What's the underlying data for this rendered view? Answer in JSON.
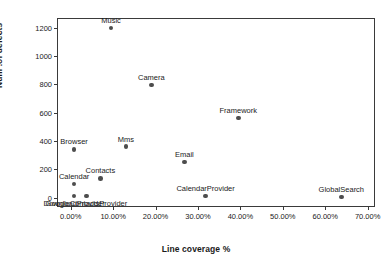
{
  "chart_data": {
    "type": "scatter",
    "title": "",
    "xlabel": "Line coverage %",
    "ylabel": "Num .of defects",
    "xlim": [
      -3.0,
      71.5
    ],
    "ylim": [
      -60,
      1260
    ],
    "grid": false,
    "legend": "none",
    "xticks": [
      "0.00%",
      "10.00%",
      "20.00%",
      "30.00%",
      "40.00%",
      "50.00%",
      "60.00%",
      "70.00%"
    ],
    "xtick_values": [
      0,
      10,
      20,
      30,
      40,
      50,
      60,
      70
    ],
    "yticks": [
      "0",
      "200",
      "400",
      "600",
      "800",
      "1000",
      "1200"
    ],
    "ytick_values": [
      0,
      200,
      400,
      600,
      800,
      1000,
      1200
    ],
    "points": [
      {
        "label": "Music",
        "x": 9.5,
        "y": 1195,
        "label_pos": "above"
      },
      {
        "label": "Camera",
        "x": 19.0,
        "y": 795,
        "label_pos": "above"
      },
      {
        "label": "Framework",
        "x": 39.5,
        "y": 560,
        "label_pos": "above"
      },
      {
        "label": "Mms",
        "x": 13.0,
        "y": 360,
        "label_pos": "above"
      },
      {
        "label": "Browser",
        "x": 0.8,
        "y": 340,
        "label_pos": "above"
      },
      {
        "label": "Email",
        "x": 26.8,
        "y": 252,
        "label_pos": "above"
      },
      {
        "label": "Contacts",
        "x": 7.0,
        "y": 135,
        "label_pos": "above"
      },
      {
        "label": "Calendar",
        "x": 0.8,
        "y": 97,
        "label_pos": "above"
      },
      {
        "label": "CalendarProvider",
        "x": 31.8,
        "y": 10,
        "label_pos": "above"
      },
      {
        "label": "GlobalSearch",
        "x": 63.8,
        "y": 5,
        "label_pos": "above"
      },
      {
        "label": "DownloadProvider",
        "x": 0.8,
        "y": 12,
        "label_pos": "below"
      },
      {
        "label": "GoogleContactsProvider",
        "x": 3.7,
        "y": 10,
        "label_pos": "below"
      }
    ]
  }
}
